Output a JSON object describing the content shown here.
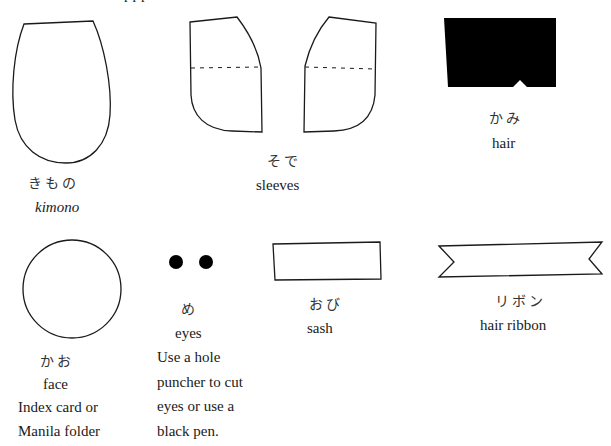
{
  "header": {
    "clipped_text": "ppp"
  },
  "items": [
    {
      "id": "kimono",
      "japanese": "きもの",
      "english": "kimono"
    },
    {
      "id": "sleeves",
      "japanese": "そで",
      "english": "sleeves"
    },
    {
      "id": "hair",
      "japanese": "かみ",
      "english": "hair"
    },
    {
      "id": "face",
      "japanese": "かお",
      "english": "face",
      "note": [
        "Index card or",
        "Manila folder"
      ]
    },
    {
      "id": "eyes",
      "japanese": "め",
      "english": "eyes",
      "note": [
        "Use a hole",
        "puncher to cut",
        "eyes or use a",
        "black pen."
      ]
    },
    {
      "id": "sash",
      "japanese": "おび",
      "english": "sash"
    },
    {
      "id": "ribbon",
      "japanese": "リボン",
      "english": "hair ribbon"
    }
  ],
  "colors": {
    "ink": "#1a1a1a",
    "fill_black": "#000000",
    "paper": "#ffffff"
  }
}
